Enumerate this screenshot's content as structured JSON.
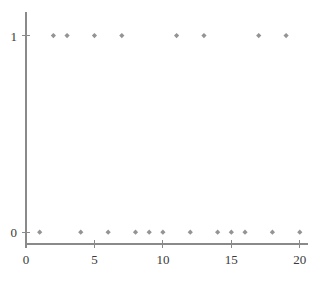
{
  "chart_data": {
    "type": "scatter",
    "title": "",
    "subtitle": "",
    "xlabel": "",
    "ylabel": "",
    "xlim": [
      0,
      20.6
    ],
    "ylim": [
      -0.06,
      1.12
    ],
    "grid": false,
    "legend": null,
    "legend_position": "none",
    "x_ticks": [
      0,
      5,
      10,
      15,
      20
    ],
    "x_tick_labels": [
      "0",
      "5",
      "10",
      "15",
      "20"
    ],
    "y_ticks": [
      0,
      1
    ],
    "y_tick_labels": [
      "0",
      "1"
    ],
    "marker": "diamond",
    "marker_color": "#949494",
    "axis_color": "#8a8a8a",
    "series": [
      {
        "name": "",
        "x": [
          1,
          2,
          3,
          4,
          5,
          6,
          7,
          8,
          9,
          10,
          11,
          12,
          13,
          14,
          15,
          16,
          17,
          18,
          19,
          20
        ],
        "values": [
          0,
          1,
          1,
          0,
          1,
          0,
          1,
          0,
          0,
          0,
          1,
          0,
          1,
          0,
          0,
          0,
          1,
          0,
          1,
          0
        ]
      }
    ],
    "points_at_one": [
      2,
      3,
      5,
      7,
      11,
      13,
      17,
      19
    ],
    "points_at_zero": [
      1,
      4,
      6,
      8,
      9,
      10,
      12,
      14,
      15,
      16,
      18,
      20
    ]
  }
}
